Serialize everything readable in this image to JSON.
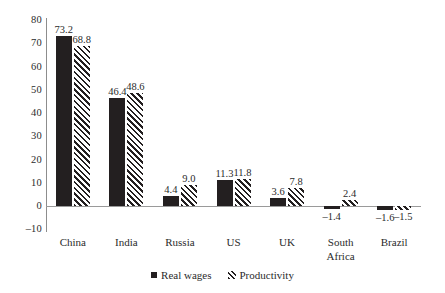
{
  "chart_data": {
    "type": "bar",
    "title": "",
    "subtitle": "",
    "xlabel": "",
    "ylabel": "",
    "ylim": [
      -10,
      80
    ],
    "ytick_step": 10,
    "yticks": [
      "80",
      "70",
      "60",
      "50",
      "40",
      "30",
      "20",
      "10",
      "0",
      "–10"
    ],
    "ytick_values": [
      80,
      70,
      60,
      50,
      40,
      30,
      20,
      10,
      0,
      -10
    ],
    "grid": false,
    "legend_position": "bottom-center",
    "categories": [
      "China",
      "India",
      "Russia",
      "US",
      "UK",
      "South Africa",
      "Brazil"
    ],
    "category_lines": [
      [
        "China"
      ],
      [
        "India"
      ],
      [
        "Russia"
      ],
      [
        "US"
      ],
      [
        "UK"
      ],
      [
        "South",
        "Africa"
      ],
      [
        "Brazil"
      ]
    ],
    "series": [
      {
        "name": "Real wages",
        "style": "solid",
        "color": "#231f20",
        "values": [
          73.2,
          46.4,
          4.4,
          11.3,
          3.6,
          -1.4,
          -1.6
        ],
        "labels": [
          "73.2",
          "46.4",
          "4.4",
          "11.3",
          "3.6",
          "–1.4",
          "–1.6"
        ]
      },
      {
        "name": "Productivity",
        "style": "diagonal-hatch",
        "color": "#231f20",
        "values": [
          68.8,
          48.6,
          9.0,
          11.8,
          7.8,
          2.4,
          -1.5
        ],
        "labels": [
          "68.8",
          "48.6",
          "9.0",
          "11.8",
          "7.8",
          "2.4",
          "–1.5"
        ]
      }
    ],
    "legend": [
      {
        "label": "Real wages",
        "marker": "solid-square-marker"
      },
      {
        "label": "Productivity",
        "marker": "diagonal-hatch-marker"
      }
    ],
    "colors": {
      "series": "#231f20",
      "axis": "#9a9a9a",
      "text": "#2b2b2b",
      "background": "#ffffff"
    }
  }
}
